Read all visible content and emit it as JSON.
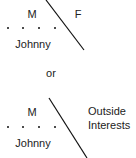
{
  "diagram_top": {
    "left_label": "M",
    "right_label": "F",
    "name_label": "Johnny"
  },
  "separator": {
    "label": "or"
  },
  "diagram_bottom": {
    "left_label": "M",
    "right_label_line1": "Outside",
    "right_label_line2": "Interests",
    "name_label": "Johnny"
  },
  "colors": {
    "line": "#111111",
    "text": "#222222",
    "background": "#ffffff"
  }
}
